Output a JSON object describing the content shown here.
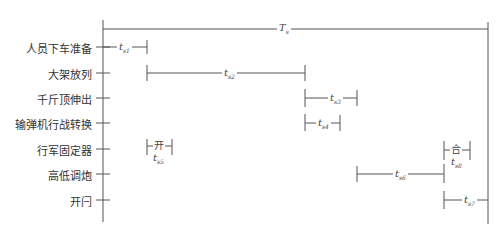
{
  "diagram": {
    "total_label": {
      "main": "T",
      "sub": "s"
    },
    "rows": [
      {
        "label": "人员下车准备",
        "y": 47
      },
      {
        "label": "大架放列",
        "y": 73
      },
      {
        "label": "千斤顶伸出",
        "y": 98
      },
      {
        "label": "输弹机行战转换",
        "y": 123
      },
      {
        "label": "行军固定器",
        "y": 149
      },
      {
        "label": "高低调炮",
        "y": 174
      },
      {
        "label": "开闩",
        "y": 200
      }
    ],
    "intervals": [
      {
        "id": "ts1",
        "main": "t",
        "sub": "s1",
        "row": 0,
        "x1": 103,
        "x2": 147
      },
      {
        "id": "ts2",
        "main": "t",
        "sub": "s2",
        "row": 1,
        "x1": 147,
        "x2": 305
      },
      {
        "id": "ts3",
        "main": "t",
        "sub": "s3",
        "row": 2,
        "x1": 305,
        "x2": 357
      },
      {
        "id": "ts4",
        "main": "t",
        "sub": "s4",
        "row": 3,
        "x1": 305,
        "x2": 340
      },
      {
        "id": "ts5",
        "main": "t",
        "sub": "s5",
        "row": 4,
        "x1": 147,
        "x2": 172,
        "state": "开"
      },
      {
        "id": "ts6",
        "main": "t",
        "sub": "s6",
        "row": 5,
        "x1": 357,
        "x2": 444
      },
      {
        "id": "ts8",
        "main": "t",
        "sub": "s8",
        "row": 4,
        "x1": 444,
        "x2": 470,
        "state": "合"
      },
      {
        "id": "ts7",
        "main": "t",
        "sub": "s7",
        "row": 6,
        "x1": 444,
        "x2": 488
      }
    ],
    "colors": {
      "line": "#555555",
      "text": "#333333"
    }
  }
}
